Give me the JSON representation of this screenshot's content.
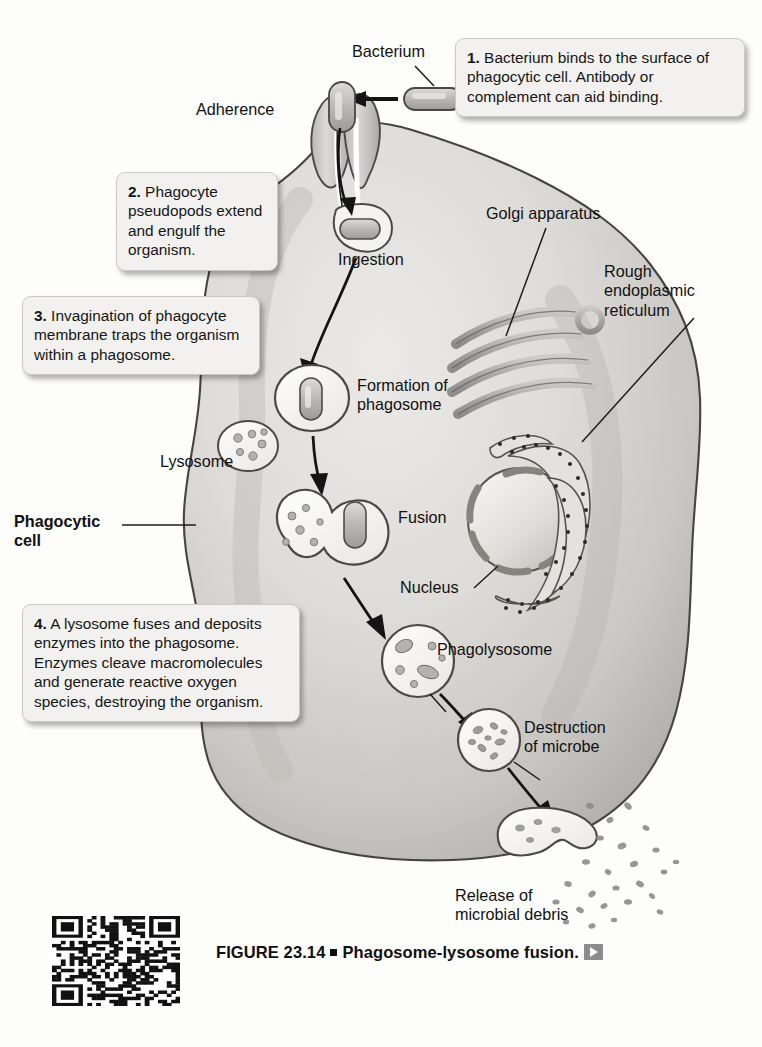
{
  "figure": {
    "number": "FIGURE 23.14",
    "title": "Phagosome-lysosome fusion.",
    "separator": "■",
    "play_icon": "play-triangle-icon"
  },
  "callouts": [
    {
      "id": "step-1",
      "number": "1.",
      "text": " Bacterium binds to the surface of phagocytic cell. Antibody or complement can aid binding."
    },
    {
      "id": "step-2",
      "number": "2.",
      "text": " Phagocyte pseudopods extend and engulf the organism."
    },
    {
      "id": "step-3",
      "number": "3.",
      "text": " Invagination of phagocyte membrane traps the organism within a phagosome."
    },
    {
      "id": "step-4",
      "number": "4.",
      "text": " A lysosome fuses and deposits enzymes into the phagosome. Enzymes cleave macromolecules and generate reactive oxygen species, destroying the organism."
    }
  ],
  "labels": {
    "bacterium": "Bacterium",
    "adherence": "Adherence",
    "ingestion": "Ingestion",
    "formation_of_phagosome": "Formation of\nphagosome",
    "lysosome": "Lysosome",
    "fusion": "Fusion",
    "phagocytic_cell": "Phagocytic\ncell",
    "golgi_apparatus": "Golgi apparatus",
    "rough_er": "Rough\nendoplasmic\nreticulum",
    "nucleus": "Nucleus",
    "phagolysosome": "Phagolysosome",
    "destruction_of_microbe": "Destruction\nof microbe",
    "release_of_debris": "Release of\nmicrobial debris"
  },
  "colors": {
    "cell_fill_light": "#e9e8e6",
    "cell_fill_mid": "#cfcecb",
    "cell_fill_dark": "#b3b2ae",
    "organelle_fill": "#b9b8b4",
    "outline": "#4a4a48",
    "callout_bg": "#f2f1ef",
    "callout_border": "#cbcac6",
    "text": "#161616"
  },
  "diagram": {
    "type": "biological-process-diagram",
    "steps": [
      "Adherence",
      "Ingestion",
      "Formation of phagosome",
      "Fusion",
      "Phagolysosome",
      "Destruction of microbe",
      "Release of microbial debris"
    ],
    "organelles": [
      "Golgi apparatus",
      "Rough endoplasmic reticulum",
      "Nucleus",
      "Lysosome"
    ]
  }
}
